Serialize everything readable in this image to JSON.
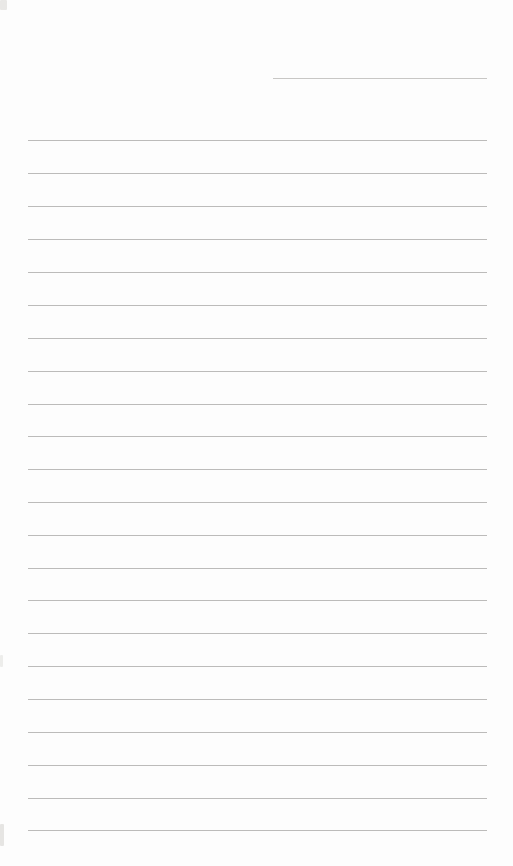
{
  "page": {
    "kind": "blank ruled notebook page (scanned, no text)",
    "width_px": 513,
    "height_px": 866,
    "background_color": "#fdfdfd",
    "rule_color": "#b5b4b2"
  },
  "header_short_line": {
    "x": 273,
    "y": 78,
    "width": 214
  },
  "ruled_lines": {
    "x": 28,
    "width": 459,
    "ys": [
      140,
      173,
      206,
      239,
      272,
      305,
      338,
      371,
      404,
      436,
      469,
      502,
      535,
      568,
      600,
      633,
      666,
      699,
      732,
      765,
      798,
      830
    ]
  },
  "scan_artifacts": {
    "corner_mark": {
      "x": 0,
      "y": 0,
      "width": 7,
      "height": 10,
      "color": "#e9e8e6"
    },
    "edge_smudges": [
      {
        "x": 0,
        "y": 655,
        "width": 3,
        "height": 12,
        "color": "#ededeb"
      },
      {
        "x": 0,
        "y": 824,
        "width": 4,
        "height": 22,
        "color": "#e6e5e3"
      }
    ]
  }
}
